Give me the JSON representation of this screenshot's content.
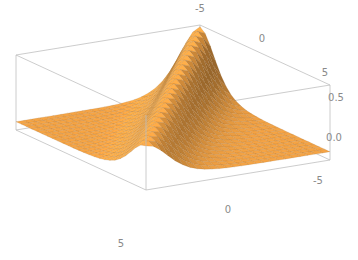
{
  "chart_data": {
    "type": "surface3d",
    "title": "",
    "function_description": "Ridge surface z = 0.75 * sech^2(x - y) style, peak along diagonal, flat ~0 elsewhere",
    "x_range": [
      -5,
      5
    ],
    "y_range": [
      -5,
      5
    ],
    "z_range": [
      -0.1,
      0.8
    ],
    "z_ticks": [
      0.0,
      0.5
    ],
    "grid_resolution": 25,
    "surface_color": "#f5a445",
    "mesh_color": "#8a5a20",
    "box_color": "#bfbfbf",
    "tick_labels": {
      "back_top_edge": [
        "-5",
        "0",
        "5"
      ],
      "front_bottom_edge": [
        "5",
        "0",
        "-5"
      ],
      "vertical_axis": [
        "0.5",
        "0.0"
      ]
    },
    "label_positions": [
      {
        "text": "-5",
        "x": 200,
        "y": 12
      },
      {
        "text": "0",
        "x": 262,
        "y": 42
      },
      {
        "text": "5",
        "x": 325,
        "y": 76
      },
      {
        "text": "0.5",
        "x": 336,
        "y": 101
      },
      {
        "text": "0.0",
        "x": 334,
        "y": 141
      },
      {
        "text": "-5",
        "x": 318,
        "y": 184
      },
      {
        "text": "0",
        "x": 228,
        "y": 213
      },
      {
        "text": "5",
        "x": 121,
        "y": 247
      }
    ]
  }
}
